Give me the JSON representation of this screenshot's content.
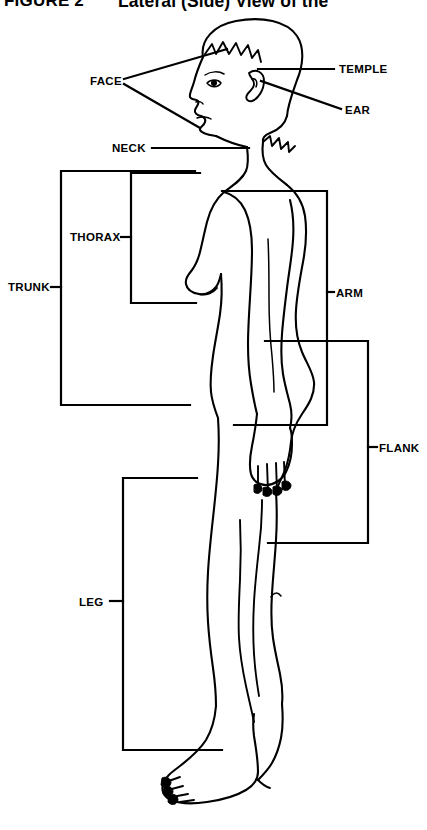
{
  "title": {
    "figure_number": "FIGURE 2",
    "caption": "Lateral (Side) View of the"
  },
  "figure": {
    "orientation": "facing-left"
  },
  "labels": {
    "face": "FACE",
    "temple": "TEMPLE",
    "ear": "EAR",
    "neck": "NECK",
    "thorax": "THORAX",
    "trunk": "TRUNK",
    "arm": "ARM",
    "flank": "FLANK",
    "leg": "LEG"
  },
  "colors": {
    "ink": "#000000",
    "paper": "#ffffff"
  },
  "regions": [
    {
      "name": "face",
      "label": "FACE",
      "label_x": 90,
      "label_y": 81,
      "side": "left"
    },
    {
      "name": "temple",
      "label": "TEMPLE",
      "label_x": 339,
      "label_y": 72,
      "side": "right"
    },
    {
      "name": "ear",
      "label": "EAR",
      "label_x": 345,
      "label_y": 114,
      "side": "right"
    },
    {
      "name": "neck",
      "label": "NECK",
      "label_x": 112,
      "label_y": 152,
      "side": "left"
    },
    {
      "name": "thorax",
      "label": "THORAX",
      "label_x": 70,
      "label_y": 241,
      "side": "left"
    },
    {
      "name": "trunk",
      "label": "TRUNK",
      "label_x": 8,
      "label_y": 291,
      "side": "left"
    },
    {
      "name": "arm",
      "label": "ARM",
      "label_x": 336,
      "label_y": 296,
      "side": "right"
    },
    {
      "name": "flank",
      "label": "FLANK",
      "label_x": 379,
      "label_y": 451,
      "side": "right"
    },
    {
      "name": "leg",
      "label": "LEG",
      "label_x": 79,
      "label_y": 605,
      "side": "left"
    }
  ]
}
